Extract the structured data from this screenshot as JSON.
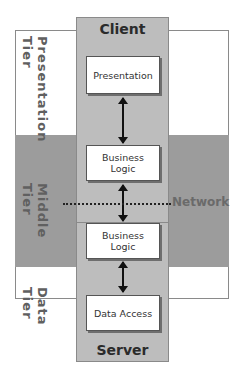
{
  "diagram": {
    "tiers": [
      {
        "id": "presentation",
        "label": "Presentation Tier",
        "line1": "Presentation",
        "line2": "Tier"
      },
      {
        "id": "middle",
        "label": "Middle Tier",
        "line1": "Middle",
        "line2": "Tier"
      },
      {
        "id": "data",
        "label": "Data Tier",
        "line1": "Data",
        "line2": "Tier"
      }
    ],
    "panels": {
      "client": "Client",
      "server": "Server"
    },
    "boxes": {
      "presentation": "Presentation",
      "client_business_logic": [
        "Business",
        "Logic"
      ],
      "server_business_logic": [
        "Business",
        "Logic"
      ],
      "data_access": "Data Access"
    },
    "network_label": "Network",
    "colors": {
      "panel_fill": "#bdbdbd",
      "middle_band": "#9c9c9c",
      "box_fill": "#ffffff",
      "network_text": "#6a6a6a"
    }
  }
}
